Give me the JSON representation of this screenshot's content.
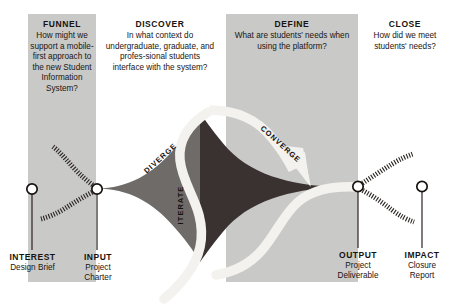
{
  "diagram": {
    "colors": {
      "band": "#c9c9c7",
      "diamond_left": "#6e6b68",
      "diamond_right": "#3a3230",
      "arrow": "#f4f2ee",
      "text": "#17120f",
      "page_background": "#ffffff"
    },
    "phases": [
      {
        "id": "funnel",
        "title": "FUNNEL",
        "question": "How might we support a mobile-first approach to the new Student Information System?",
        "banded": true
      },
      {
        "id": "discover",
        "title": "DISCOVER",
        "question": "In what context do undergraduate, graduate, and profes-sional students interface with the system?",
        "banded": false
      },
      {
        "id": "define",
        "title": "DEFINE",
        "question": "What are students' needs when using the platform?",
        "banded": true
      },
      {
        "id": "close",
        "title": "CLOSE",
        "question": "How did we meet students' needs?",
        "banded": false
      }
    ],
    "milestones": [
      {
        "id": "interest",
        "name": "INTEREST",
        "sub": "Design Brief"
      },
      {
        "id": "input",
        "name": "INPUT",
        "sub": "Project Charter"
      },
      {
        "id": "output",
        "name": "OUTPUT",
        "sub": "Project Deliverable"
      },
      {
        "id": "impact",
        "name": "IMPACT",
        "sub": "Closure Report"
      }
    ],
    "flow_labels": [
      {
        "id": "diverge",
        "text": "DIVERGE"
      },
      {
        "id": "iterate",
        "text": "ITERATE"
      },
      {
        "id": "converge",
        "text": "CONVERGE"
      }
    ]
  }
}
